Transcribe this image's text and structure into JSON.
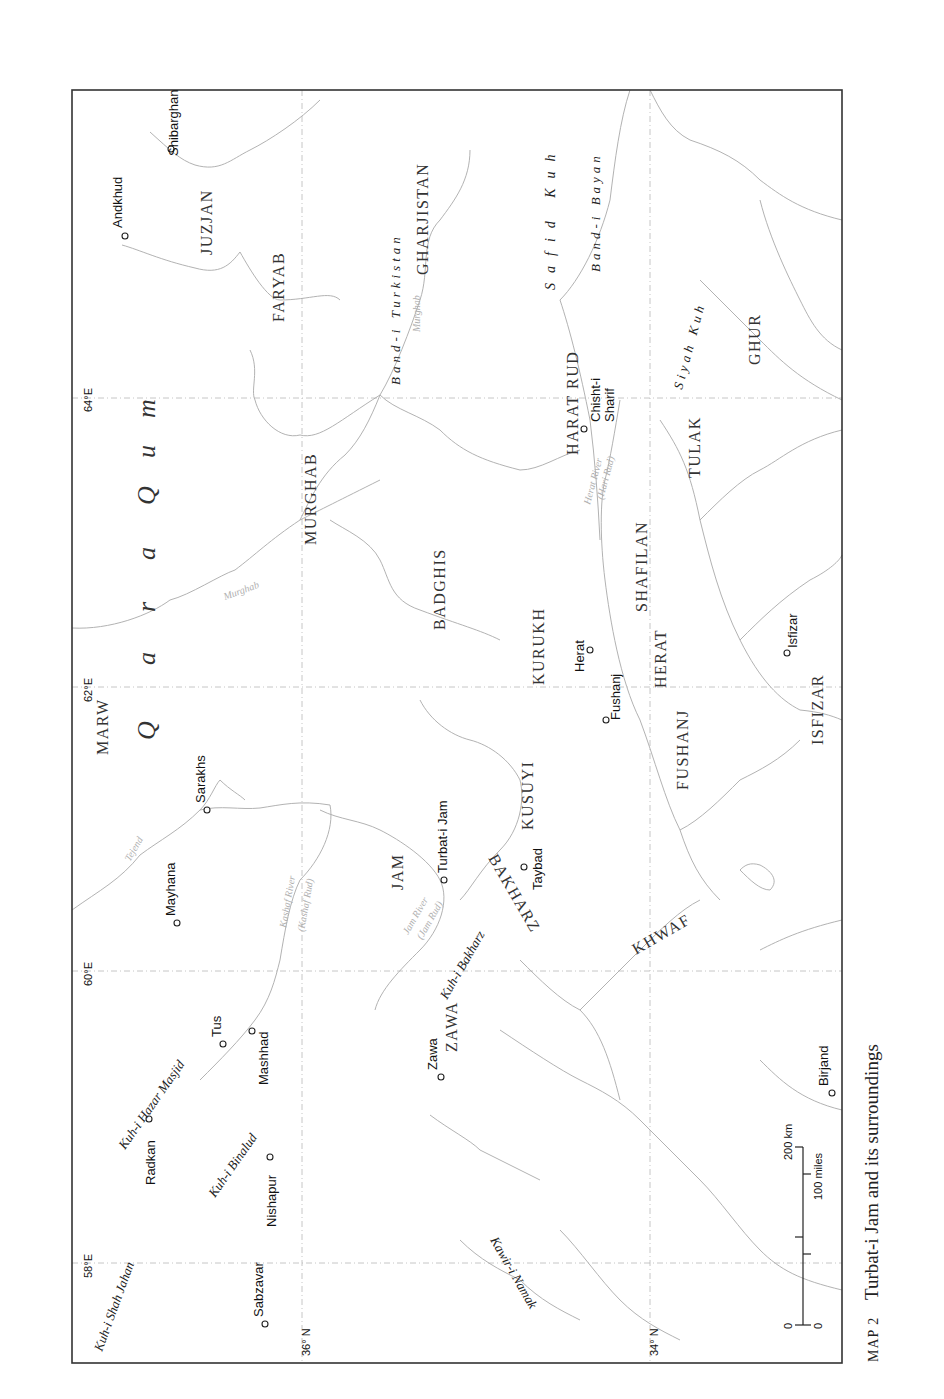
{
  "map": {
    "caption": {
      "prefix": "MAP 2",
      "title": "Turbat-i Jam and its surroundings"
    },
    "orientation": "rotated 90° counter-clockwise (north to the left)",
    "coordinates": {
      "longitudes": [
        "58°E",
        "60°E",
        "62°E",
        "64°E"
      ],
      "latitudes": [
        "36° N",
        "34° N"
      ]
    },
    "desert_label": [
      "Q",
      "a",
      "r",
      "a",
      "Q",
      "u",
      "m"
    ],
    "regions": [
      "MARW",
      "MURGHAB",
      "FARYAB",
      "JUZJAN",
      "GHARJISTAN",
      "BADGHIS",
      "KURUKH",
      "KUSUYI",
      "HARAT RUD",
      "SHAFILAN",
      "HERAT",
      "FUSHANJ",
      "TULAK",
      "GHUR",
      "ISFIZAR",
      "JAM",
      "BAKHARZ",
      "KHWAF",
      "ZAWA"
    ],
    "towns": [
      "Andkhud",
      "Shibarghan",
      "Sarakhs",
      "Mayhana",
      "Tus",
      "Mashhad",
      "Radkan",
      "Nishapur",
      "Sabzavar",
      "Turbat-i Jam",
      "Taybad",
      "Herat",
      "Fushanj",
      "Chisht-i",
      "Sharif",
      "Isfizar",
      "Zawa",
      "Birjand"
    ],
    "mountains": [
      "Band-i Turkistan",
      "Safid Kuh",
      "Band-i Bayan",
      "Siyah Kuh",
      "Kuh-i Hazar Masjid",
      "Kuh-i Binalud",
      "Kuh-i Shah Jahan",
      "Kuh-i Bakharz",
      "Kawir-i Namak"
    ],
    "rivers": [
      "Murghab",
      "Murghab",
      "Tejend",
      "Kashaf River",
      "(Kashaf Rud)",
      "Jam River",
      "(Jam Rud)",
      "Herat River",
      "(Hari Rud)"
    ],
    "scale": {
      "zero_km": "0",
      "zero_mi": "0",
      "km": "200 km",
      "miles": "100 miles"
    }
  }
}
